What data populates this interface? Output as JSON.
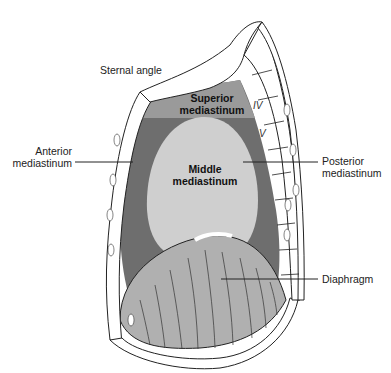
{
  "figure": {
    "colors": {
      "superior": "#9a9a9a",
      "anterior_posterior": "#6e6e6e",
      "middle": "#cfcfcf",
      "diaphragm": "#b4b4b4",
      "bone": "#ffffff",
      "outline": "#222222"
    }
  },
  "labels": {
    "sternal_angle": "Sternal angle",
    "superior_1": "Superior",
    "superior_2": "mediastinum",
    "anterior_1": "Anterior",
    "anterior_2": "mediastinum",
    "middle_1": "Middle",
    "middle_2": "mediastinum",
    "posterior_1": "Posterior",
    "posterior_2": "mediastinum",
    "diaphragm": "Diaphragm"
  },
  "vertebrae": {
    "iv": "IV",
    "v": "V"
  }
}
